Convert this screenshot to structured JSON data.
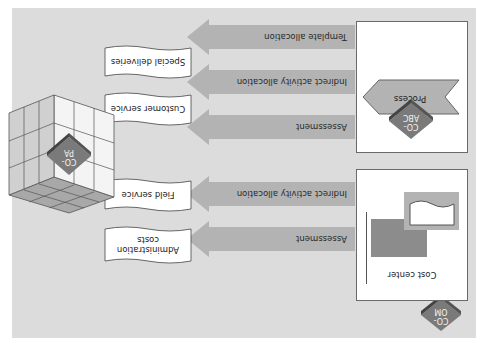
{
  "diagram": {
    "orientation_note": "rotated 180 degrees",
    "colors": {
      "background_panel": "#dcdcdc",
      "arrow_fill": "#b3b3b3",
      "box_fill": "#ffffff",
      "diamond_top": "#7a7a7a",
      "diamond_side": "#4d4d4d",
      "cost_center_rect": "#8c8c8c",
      "process_shape": "#b3b3b3"
    },
    "modules": {
      "co_om": {
        "line1": "CO-",
        "line2": "OM"
      },
      "co_abc": {
        "line1": "CO-",
        "line2": "ABC"
      },
      "co_pa": {
        "line1": "CO-",
        "line2": "PA"
      }
    },
    "sources": {
      "cost_center": {
        "label": "Cost center"
      },
      "process": {
        "label": "Process"
      }
    },
    "flows": [
      {
        "label": "Assessment",
        "target": "Administration costs"
      },
      {
        "label": "Indirect activity allocation",
        "target": "Field service"
      },
      {
        "label": "Assessment",
        "target": "Customer service"
      },
      {
        "label": "Indirect activity allocation",
        "target": "Special deliveries"
      },
      {
        "label": "Template allocation",
        "target": ""
      }
    ],
    "targets": [
      {
        "label": "Administration costs"
      },
      {
        "label": "Field service"
      },
      {
        "label": "Customer service"
      },
      {
        "label": "Special deliveries"
      }
    ]
  }
}
